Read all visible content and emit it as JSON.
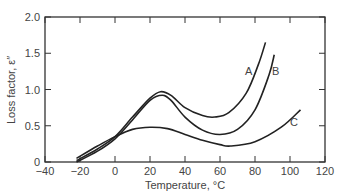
{
  "chart_data": {
    "type": "line",
    "title": "",
    "xlabel": "Temperature, °C",
    "ylabel": "Loss factor, ε″",
    "xlim": [
      -40,
      120
    ],
    "ylim": [
      0,
      2.0
    ],
    "x_ticks": [
      "-40",
      "-20",
      "0",
      "20",
      "40",
      "60",
      "80",
      "100",
      "120"
    ],
    "y_ticks": [
      "0",
      "0.5",
      "1.0",
      "1.5",
      "2.0"
    ],
    "grid": false,
    "legend": "inline labels",
    "series": [
      {
        "name": "A",
        "x": [
          -22,
          -10,
          0,
          10,
          20,
          26,
          32,
          40,
          50,
          57,
          65,
          75,
          82,
          86
        ],
        "y": [
          0.02,
          0.18,
          0.35,
          0.62,
          0.88,
          0.97,
          0.92,
          0.75,
          0.64,
          0.62,
          0.68,
          0.95,
          1.35,
          1.65
        ]
      },
      {
        "name": "B",
        "x": [
          -22,
          -10,
          0,
          10,
          20,
          27,
          32,
          40,
          50,
          60,
          70,
          80,
          88,
          91
        ],
        "y": [
          0.0,
          0.15,
          0.32,
          0.58,
          0.85,
          0.92,
          0.85,
          0.62,
          0.44,
          0.38,
          0.45,
          0.72,
          1.2,
          1.48
        ]
      },
      {
        "name": "C",
        "x": [
          -22,
          -10,
          0,
          10,
          20,
          30,
          40,
          50,
          60,
          66,
          80,
          95,
          106
        ],
        "y": [
          0.05,
          0.22,
          0.35,
          0.45,
          0.48,
          0.46,
          0.38,
          0.3,
          0.24,
          0.22,
          0.28,
          0.48,
          0.72
        ]
      }
    ],
    "annotations": [
      "A",
      "B",
      "C"
    ]
  }
}
